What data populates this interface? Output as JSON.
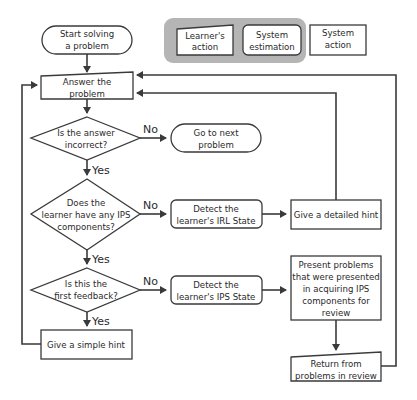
{
  "legend": {
    "items": [
      {
        "label_lines": [
          "Learner's",
          "action"
        ],
        "shape": "manual-input"
      },
      {
        "label_lines": [
          "System",
          "estimation"
        ],
        "shape": "rounded-rect"
      },
      {
        "label_lines": [
          "System",
          "action"
        ],
        "shape": "rect"
      }
    ],
    "background": "#b5b5b5"
  },
  "nodes": {
    "start": {
      "lines": [
        "Start solving",
        "a problem"
      ],
      "shape": "terminator"
    },
    "answer": {
      "lines": [
        "Answer the",
        "problem"
      ],
      "shape": "manual-input"
    },
    "q_incorrect": {
      "lines": [
        "Is the answer",
        "incorrect?"
      ],
      "shape": "decision"
    },
    "next_problem": {
      "lines": [
        "Go to next",
        "problem"
      ],
      "shape": "terminator"
    },
    "q_ips": {
      "lines": [
        "Does the",
        "learner have any IPS",
        "components?"
      ],
      "shape": "decision"
    },
    "detect_irl": {
      "lines": [
        "Detect the",
        "learner's IRL State"
      ],
      "shape": "rounded-rect"
    },
    "detailed_hint": {
      "lines": [
        "Give a detailed hint"
      ],
      "shape": "rect"
    },
    "q_first": {
      "lines": [
        "Is this the",
        "first feedback?"
      ],
      "shape": "decision"
    },
    "detect_ips": {
      "lines": [
        "Detect the",
        "learner's IPS State"
      ],
      "shape": "rounded-rect"
    },
    "present_review": {
      "lines": [
        "Present problems",
        "that were presented",
        "in acquiring IPS",
        "components for",
        "review"
      ],
      "shape": "rect"
    },
    "simple_hint": {
      "lines": [
        "Give a simple hint"
      ],
      "shape": "rect"
    },
    "return_review": {
      "lines": [
        "Return from",
        "problems in review"
      ],
      "shape": "manual-input"
    }
  },
  "edge_labels": {
    "no": "No",
    "yes": "Yes"
  },
  "colors": {
    "stroke": "#3a3a3a",
    "text": "#2a2a2a",
    "legend_bg": "#b5b5b5"
  }
}
